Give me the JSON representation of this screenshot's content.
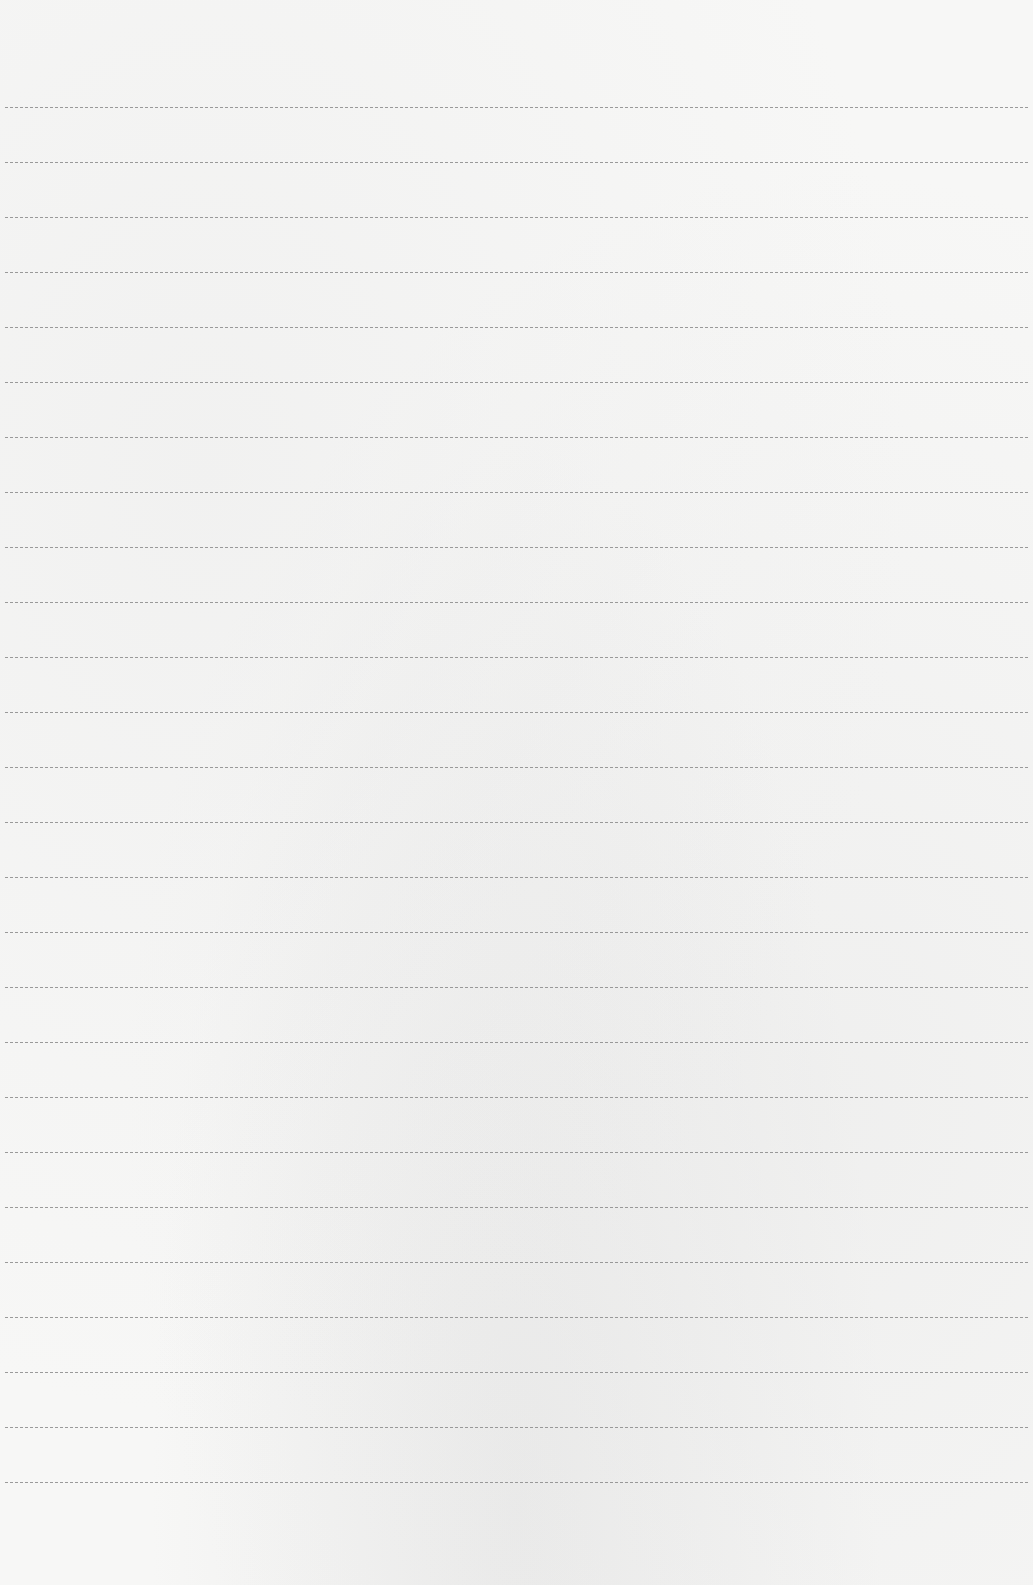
{
  "page": {
    "type": "lined-paper",
    "background_color": "#f7f7f6",
    "line_color": "#8a8a8a",
    "line_count": 26,
    "first_line_y": 107,
    "line_spacing": 55,
    "line_left": 5,
    "line_right": 1028
  }
}
